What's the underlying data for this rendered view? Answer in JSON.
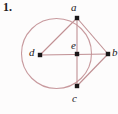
{
  "figure": {
    "item_number": "1.",
    "background_color": "#fdfcfc",
    "stroke_color": "#c08f93",
    "circle_color": "#c89a9e",
    "point_color": "#1a1718",
    "label_color": "#232022",
    "width": 118,
    "height": 114,
    "circle": {
      "cx": 56.5,
      "cy": 53.5,
      "r": 35.0
    },
    "points": [
      {
        "id": "a",
        "label": "a",
        "x": 77,
        "y": 18,
        "label_x": 71,
        "label_y": 2
      },
      {
        "id": "b",
        "label": "b",
        "x": 108,
        "y": 54,
        "label_x": 112,
        "label_y": 47
      },
      {
        "id": "c",
        "label": "c",
        "x": 77,
        "y": 86,
        "label_x": 72,
        "label_y": 93
      },
      {
        "id": "d",
        "label": "d",
        "x": 40,
        "y": 55,
        "label_x": 29,
        "label_y": 47
      },
      {
        "id": "e",
        "label": "e",
        "x": 77,
        "y": 54,
        "label_x": 71,
        "label_y": 40
      }
    ],
    "segments": [
      {
        "id": "d-a",
        "from": "d",
        "to": "a"
      },
      {
        "id": "d-b",
        "from": "d",
        "to": "b"
      },
      {
        "id": "a-c",
        "from": "a",
        "to": "c"
      },
      {
        "id": "a-b",
        "from": "a",
        "to": "b"
      },
      {
        "id": "c-b",
        "from": "c",
        "to": "b"
      }
    ]
  }
}
